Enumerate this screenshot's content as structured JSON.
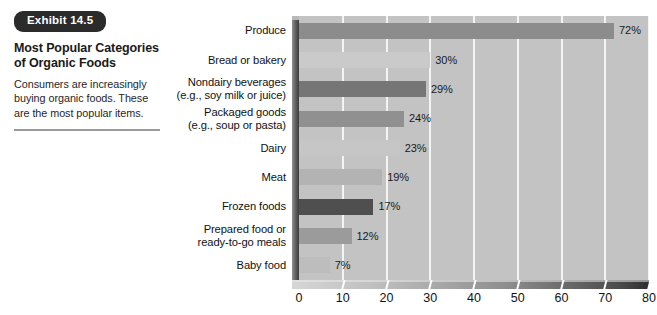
{
  "exhibit": {
    "tag": "Exhibit 14.5",
    "title": "Most Popular Categories of Organic Foods",
    "description": "Consumers are increasingly buying organic foods. These are the most popular items."
  },
  "chart_data": {
    "type": "bar",
    "orientation": "horizontal",
    "title": "Most Popular Categories of Organic Foods",
    "xlabel": "",
    "ylabel": "",
    "xlim": [
      0,
      80
    ],
    "xticks": [
      0,
      10,
      20,
      30,
      40,
      50,
      60,
      70,
      80
    ],
    "xtick_labels": [
      "0",
      "10",
      "20",
      "30",
      "40",
      "50",
      "60",
      "70",
      "80"
    ],
    "grid": true,
    "legend": "none",
    "value_suffix": "%",
    "categories": [
      "Produce",
      "Bread or bakery",
      "Nondairy beverages\n(e.g., soy milk or juice)",
      "Packaged goods\n(e.g., soup or pasta)",
      "Dairy",
      "Meat",
      "Frozen foods",
      "Prepared food or\nready-to-go meals",
      "Baby food"
    ],
    "values": [
      72,
      30,
      29,
      24,
      23,
      19,
      17,
      12,
      7
    ],
    "value_labels": [
      "72%",
      "30%",
      "29%",
      "24%",
      "23%",
      "19%",
      "17%",
      "12%",
      "7%"
    ],
    "bar_colors": [
      "#8c8c8c",
      "#cacaca",
      "#767676",
      "#909090",
      "#c6c6c6",
      "#b3b3b3",
      "#4f4f4f",
      "#9b9b9b",
      "#bdbdbd"
    ],
    "plot_background": "#c3c3c3",
    "gridline_color": "#f4f4f4"
  },
  "colors": {
    "tag_background": "#2b2b2b",
    "tag_text": "#ffffff",
    "page_background": "#ffffff",
    "rule": "#9a9a9a"
  }
}
